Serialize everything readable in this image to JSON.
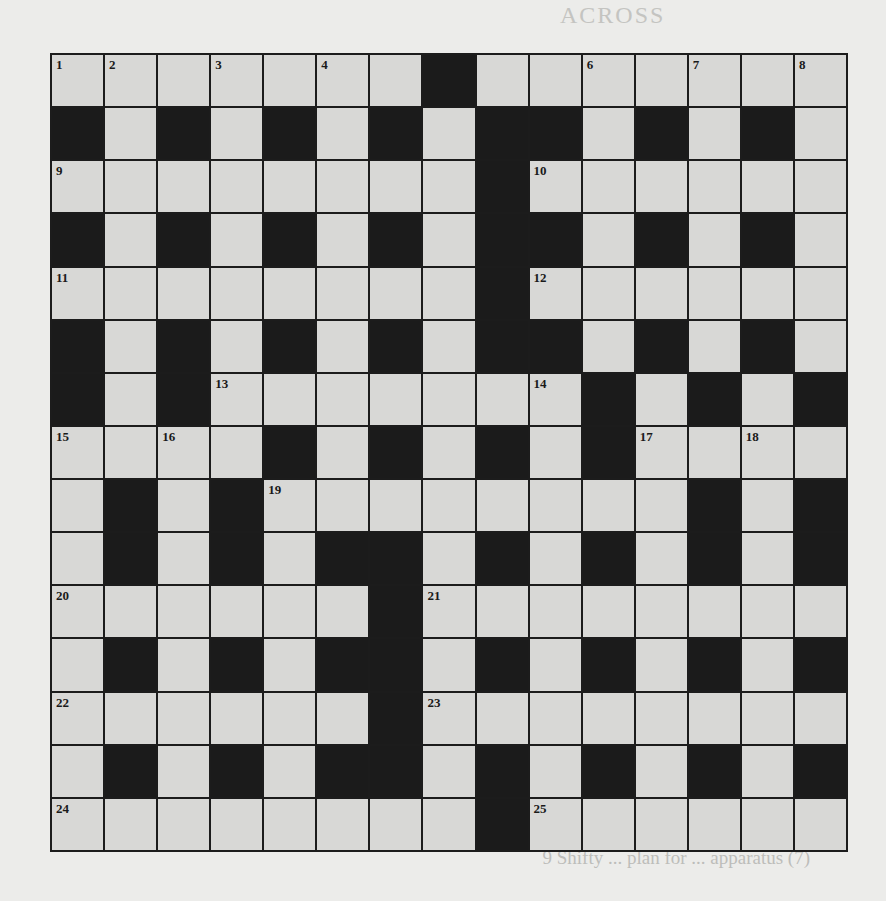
{
  "document": {
    "type": "crossword",
    "rows": 15,
    "cols": 15
  },
  "crossword": {
    "layout": [
      "WWWWWWWBWWWWWWW",
      "BWBWBWBWBBWBWBW",
      "WWWWWWWWBWWWWWW",
      "BWBWBWBWBBWBWBW",
      "WWWWWWWWBWWWWWW",
      "BWBWBWBWBBWBWBW",
      "BWBWWWWWWWBWBWB",
      "WWWWBWBWBWBWWWW",
      "WBWBWWWWWWWWBWB",
      "WBWBWBBWBWBWBWB",
      "WWWWWWBWWWWWWWW",
      "WBWBWBBWBWBWBWB",
      "WWWWWWBWWWWWWWW",
      "WBWBWBBWBWBWBWB",
      "WWWWWWWWBWWWWWW"
    ],
    "numbers": [
      {
        "row": 0,
        "col": 0,
        "n": "1"
      },
      {
        "row": 0,
        "col": 1,
        "n": "2"
      },
      {
        "row": 0,
        "col": 3,
        "n": "3"
      },
      {
        "row": 0,
        "col": 5,
        "n": "4"
      },
      {
        "row": 0,
        "col": 7,
        "n": "5"
      },
      {
        "row": 0,
        "col": 10,
        "n": "6"
      },
      {
        "row": 0,
        "col": 12,
        "n": "7"
      },
      {
        "row": 0,
        "col": 14,
        "n": "8"
      },
      {
        "row": 2,
        "col": 0,
        "n": "9"
      },
      {
        "row": 2,
        "col": 9,
        "n": "10"
      },
      {
        "row": 4,
        "col": 0,
        "n": "11"
      },
      {
        "row": 4,
        "col": 9,
        "n": "12"
      },
      {
        "row": 6,
        "col": 3,
        "n": "13"
      },
      {
        "row": 6,
        "col": 9,
        "n": "14"
      },
      {
        "row": 7,
        "col": 0,
        "n": "15"
      },
      {
        "row": 7,
        "col": 2,
        "n": "16"
      },
      {
        "row": 7,
        "col": 11,
        "n": "17"
      },
      {
        "row": 7,
        "col": 13,
        "n": "18"
      },
      {
        "row": 8,
        "col": 4,
        "n": "19"
      },
      {
        "row": 10,
        "col": 0,
        "n": "20"
      },
      {
        "row": 10,
        "col": 7,
        "n": "21"
      },
      {
        "row": 12,
        "col": 0,
        "n": "22"
      },
      {
        "row": 12,
        "col": 7,
        "n": "23"
      },
      {
        "row": 14,
        "col": 0,
        "n": "24"
      },
      {
        "row": 14,
        "col": 9,
        "n": "25"
      }
    ]
  },
  "showthrough": {
    "across_heading": "ACROSS",
    "down_heading": "DOWN",
    "across_lines": [
      "1  Key worker's small supply of food (9)",
      "9  Not on holiday, but having a ball? (9)",
      "10  ... appear ... suddenly ... away (6)",
      "11  ... on the ... rocks (8)",
      "12  Some form of money, rarely ... as payment (7)",
      "13  ... Tory ... and ... (5)",
      "14  ... around ... time",
      "15  ... (7)",
      "16  Odd part of tree leaves (5)",
      "20  ... (6)",
      "23  ... role ... certain ... (7)",
      "22  ... student ... empty theatre (6)",
      "24  ... make ... (5)",
      "27  Outdated ... to belong to ... (8)",
      "28  Pop ... (5)",
      "    Duty ... make a ... (6)"
    ],
    "down_lines": [
      "1  ... requirement ... (8)",
      "2  ... (6)",
      "3  Plant in metal container ... (9)",
      "4  ... (7)",
      "6  Still ... (2)",
      "7  ... written (7)",
      "8  ... known (5)",
      "9  Shifty ... plan for ... apparatus (7)"
    ]
  }
}
